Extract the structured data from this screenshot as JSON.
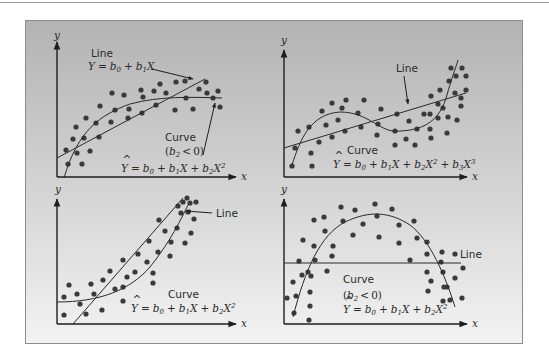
{
  "figure": {
    "panels": [
      {
        "id": "top-left",
        "axis_x": "x",
        "axis_y": "y",
        "line_label": "Line",
        "line_equation": "Y = b0 + b1X",
        "curve_label": "Curve",
        "curve_condition": "(b2 < 0)",
        "curve_equation": "Ŷ = b0 + b1X + b2X²"
      },
      {
        "id": "top-right",
        "axis_x": "x",
        "axis_y": "y",
        "line_label": "Line",
        "curve_label": "Curve",
        "curve_equation": "Ŷ = b0 + b1X + b2X² + b3X³"
      },
      {
        "id": "bottom-left",
        "axis_x": "x",
        "axis_y": "y",
        "line_label": "Line",
        "curve_label": "Curve",
        "curve_equation": "Ŷ = b0 + b1X + b2X²"
      },
      {
        "id": "bottom-right",
        "axis_x": "x",
        "axis_y": "y",
        "line_label": "Line",
        "curve_label": "Curve",
        "curve_condition": "(b2 < 0)",
        "curve_equation": "Ŷ = b0 + b1X + b2X²"
      }
    ]
  },
  "text": {
    "x": "x",
    "y": "y",
    "Y": "Y",
    "eq": "=",
    "plus": "+",
    "lt": "<",
    "b": "b",
    "X": "X",
    "s0": "0",
    "s1": "1",
    "s2": "2",
    "s3": "3",
    "line": "Line",
    "curve": "Curve",
    "lp": "(",
    "rp": ")",
    "zero": "0"
  },
  "colors": {
    "panel_top": "#b3b3b3",
    "panel_bottom": "#f3f3f3",
    "ink": "#2a2a2a",
    "dot": "#3a3a3a"
  }
}
